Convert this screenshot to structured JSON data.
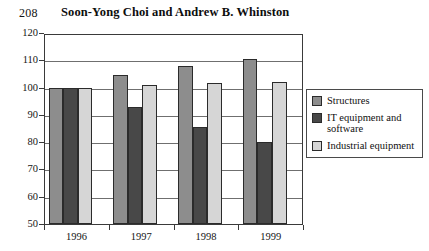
{
  "page": {
    "folio": "208",
    "running_title": "Soon-Yong Choi and Andrew B. Whinston"
  },
  "legend": {
    "items": [
      {
        "label": "Structures",
        "color": "#8d8d8d"
      },
      {
        "label": "IT equipment and software",
        "color": "#484848"
      },
      {
        "label": "Industrial equipment",
        "color": "#d6d6d6"
      }
    ]
  },
  "chart_data": {
    "type": "bar",
    "title": "",
    "xlabel": "",
    "ylabel": "",
    "categories": [
      "1996",
      "1997",
      "1998",
      "1999"
    ],
    "series": [
      {
        "name": "Structures",
        "color": "#8d8d8d",
        "values": [
          100,
          104.5,
          108,
          110.5
        ]
      },
      {
        "name": "IT equipment and software",
        "color": "#484848",
        "values": [
          100,
          93,
          85.5,
          80
        ]
      },
      {
        "name": "Industrial equipment",
        "color": "#d6d6d6",
        "values": [
          100,
          101,
          101.5,
          102
        ]
      }
    ],
    "ylim": [
      50,
      120
    ],
    "yticks": [
      50,
      60,
      70,
      80,
      90,
      100,
      110,
      120
    ],
    "ytick_labels": [
      "50",
      "60",
      "70",
      "80",
      "90",
      "100",
      "110",
      "120"
    ],
    "grid": true,
    "grid_axis": "y",
    "legend_position": "right"
  }
}
